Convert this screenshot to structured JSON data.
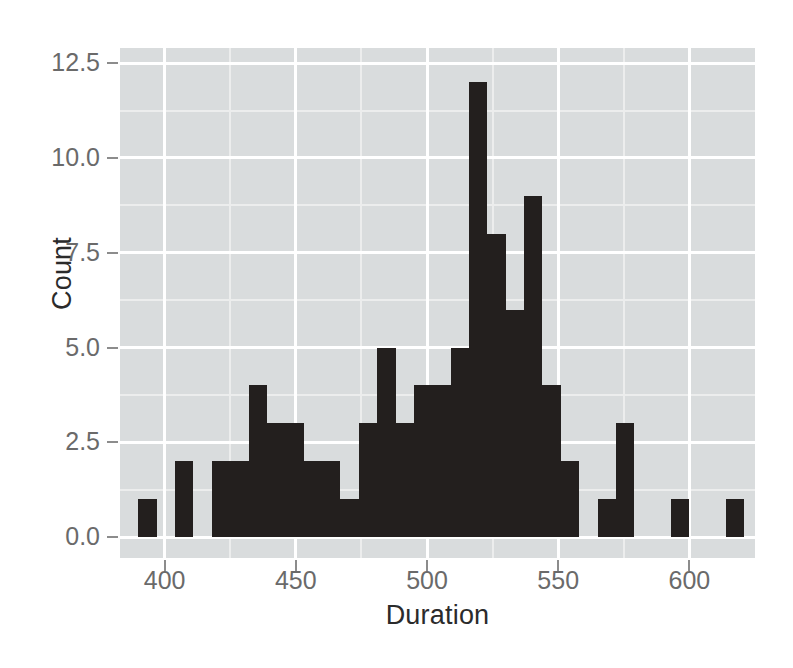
{
  "chart_data": {
    "type": "bar",
    "subtype": "histogram",
    "title": "",
    "xlabel": "Duration",
    "ylabel": "Count",
    "xlim": [
      383,
      625
    ],
    "ylim": [
      -0.55,
      12.9
    ],
    "grid": true,
    "legend": null,
    "bin_width": 7,
    "panel_background": "#d9dcdd",
    "bar_color": "#231f1e",
    "gridline_color": "#ffffff",
    "axis_text_color": "#6a6a6a",
    "x_ticks": [
      400,
      450,
      500,
      550,
      600
    ],
    "x_tick_labels": [
      "400",
      "450",
      "500",
      "550",
      "600"
    ],
    "x_minor_ticks": [
      375,
      425,
      475,
      525,
      575
    ],
    "y_ticks": [
      0.0,
      2.5,
      5.0,
      7.5,
      10.0,
      12.5
    ],
    "y_tick_labels": [
      "0.0",
      "2.5",
      "5.0",
      "7.5",
      "10.0",
      "12.5"
    ],
    "y_minor_ticks": [
      1.25,
      3.75,
      6.25,
      8.75,
      11.25
    ],
    "bins": [
      {
        "x0": 390,
        "x1": 397,
        "count": 1
      },
      {
        "x0": 404,
        "x1": 411,
        "count": 2
      },
      {
        "x0": 418,
        "x1": 425,
        "count": 2
      },
      {
        "x0": 425,
        "x1": 432,
        "count": 2
      },
      {
        "x0": 432,
        "x1": 439,
        "count": 4
      },
      {
        "x0": 439,
        "x1": 446,
        "count": 3
      },
      {
        "x0": 446,
        "x1": 453,
        "count": 3
      },
      {
        "x0": 453,
        "x1": 460,
        "count": 2
      },
      {
        "x0": 460,
        "x1": 467,
        "count": 2
      },
      {
        "x0": 467,
        "x1": 474,
        "count": 1
      },
      {
        "x0": 474,
        "x1": 481,
        "count": 3
      },
      {
        "x0": 481,
        "x1": 488,
        "count": 5
      },
      {
        "x0": 488,
        "x1": 495,
        "count": 3
      },
      {
        "x0": 495,
        "x1": 502,
        "count": 4
      },
      {
        "x0": 502,
        "x1": 509,
        "count": 4
      },
      {
        "x0": 509,
        "x1": 516,
        "count": 5
      },
      {
        "x0": 516,
        "x1": 523,
        "count": 12
      },
      {
        "x0": 523,
        "x1": 530,
        "count": 8
      },
      {
        "x0": 530,
        "x1": 537,
        "count": 6
      },
      {
        "x0": 537,
        "x1": 544,
        "count": 9
      },
      {
        "x0": 544,
        "x1": 551,
        "count": 4
      },
      {
        "x0": 551,
        "x1": 558,
        "count": 2
      },
      {
        "x0": 565,
        "x1": 572,
        "count": 1
      },
      {
        "x0": 572,
        "x1": 579,
        "count": 3
      },
      {
        "x0": 593,
        "x1": 600,
        "count": 1
      },
      {
        "x0": 614,
        "x1": 621,
        "count": 1
      },
      {
        "x0": 628,
        "x1": 642,
        "count": 1
      }
    ]
  }
}
